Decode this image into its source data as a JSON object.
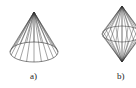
{
  "figures": [
    {
      "id": "a",
      "label": "a)",
      "shape": "cone",
      "apex": [
        34,
        12
      ],
      "base_center": [
        34,
        52
      ],
      "rx": 24,
      "ry": 10,
      "generators": 20
    },
    {
      "id": "b",
      "label": "b)",
      "shape": "bicone",
      "apex_top": [
        122,
        6
      ],
      "apex_bottom": [
        122,
        62
      ],
      "mid_center": [
        122,
        34
      ],
      "rx": 20,
      "ry": 8,
      "generators": 20
    }
  ],
  "colors": {
    "stroke": "#333333",
    "background": "#ffffff"
  }
}
